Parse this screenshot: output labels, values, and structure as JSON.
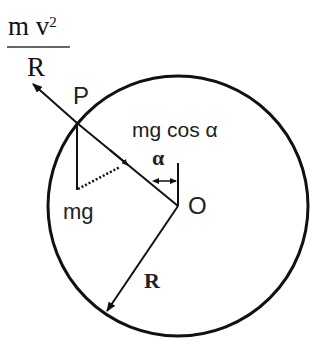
{
  "diagram": {
    "fraction": {
      "numerator_m": "m",
      "numerator_v": "v",
      "exponent": "2",
      "denominator": "R"
    },
    "labels": {
      "point_p": "P",
      "center_o": "O",
      "weight": "mg",
      "component": "mg cos α",
      "angle": "α",
      "radius": "R"
    },
    "colors": {
      "stroke": "#111111",
      "background": "#ffffff"
    },
    "geometry": {
      "circle_center": [
        178,
        206
      ],
      "circle_radius": 130,
      "point_p": [
        77,
        123
      ],
      "centripetal_arrow_tip": [
        33,
        84
      ],
      "radius_arrow_tip": [
        106,
        313
      ]
    }
  }
}
